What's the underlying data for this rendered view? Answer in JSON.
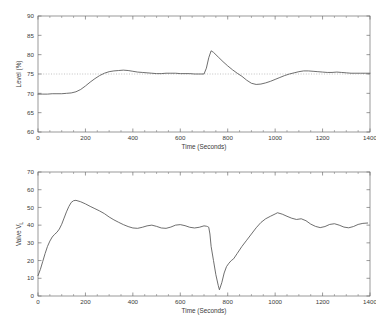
{
  "page": {
    "title_remnant": "",
    "background": "#ffffff",
    "line_color": "#555555",
    "axis_color": "#6e6e6e",
    "setpoint_color": "#9a9a9a"
  },
  "chart_data": [
    {
      "type": "line",
      "id": "level-chart",
      "title": "",
      "xlabel": "Time (Seconds)",
      "ylabel": "Level (%)",
      "xlim": [
        0,
        1400
      ],
      "ylim": [
        60,
        90
      ],
      "xticks": [
        0,
        200,
        400,
        600,
        800,
        1000,
        1200,
        1400
      ],
      "yticks": [
        60,
        65,
        70,
        75,
        80,
        85,
        90
      ],
      "grid": false,
      "legend": "none",
      "annotations": [
        {
          "kind": "setpoint-line",
          "y": 75,
          "style": "dotted"
        }
      ],
      "series": [
        {
          "name": "Level",
          "x": [
            0,
            20,
            40,
            60,
            80,
            100,
            120,
            140,
            160,
            180,
            200,
            220,
            240,
            260,
            280,
            300,
            320,
            340,
            360,
            380,
            400,
            420,
            440,
            460,
            480,
            500,
            520,
            540,
            560,
            580,
            600,
            620,
            640,
            660,
            680,
            700,
            710,
            720,
            730,
            740,
            760,
            780,
            800,
            820,
            840,
            860,
            880,
            900,
            920,
            940,
            960,
            980,
            1000,
            1020,
            1040,
            1060,
            1080,
            1100,
            1120,
            1140,
            1160,
            1180,
            1200,
            1220,
            1240,
            1260,
            1280,
            1300,
            1320,
            1340,
            1360,
            1380,
            1400
          ],
          "y": [
            69.8,
            69.8,
            69.8,
            69.9,
            69.9,
            69.9,
            70.0,
            70.1,
            70.4,
            71.0,
            71.9,
            72.9,
            73.8,
            74.6,
            75.2,
            75.6,
            75.8,
            75.9,
            76.0,
            75.9,
            75.7,
            75.5,
            75.4,
            75.3,
            75.2,
            75.1,
            75.1,
            75.2,
            75.2,
            75.2,
            75.1,
            75.1,
            75.1,
            75.0,
            75.0,
            75.0,
            76.5,
            79.2,
            81.0,
            80.6,
            79.4,
            78.2,
            77.1,
            76.1,
            75.2,
            74.4,
            73.4,
            72.6,
            72.3,
            72.4,
            72.7,
            73.1,
            73.6,
            74.1,
            74.6,
            75.0,
            75.3,
            75.6,
            75.8,
            75.8,
            75.7,
            75.6,
            75.5,
            75.4,
            75.4,
            75.5,
            75.4,
            75.3,
            75.2,
            75.2,
            75.2,
            75.2,
            75.2
          ]
        }
      ]
    },
    {
      "type": "line",
      "id": "valve-chart",
      "title": "",
      "xlabel": "Time (Seconds)",
      "ylabel": "Valve V",
      "ylabel_sub": "L",
      "xlim": [
        0,
        1400
      ],
      "ylim": [
        0,
        70
      ],
      "xticks": [
        0,
        200,
        400,
        600,
        800,
        1000,
        1200,
        1400
      ],
      "yticks": [
        0,
        10,
        20,
        30,
        40,
        50,
        60,
        70
      ],
      "grid": false,
      "legend": "none",
      "annotations": [],
      "series": [
        {
          "name": "Valve VL",
          "x": [
            0,
            10,
            20,
            30,
            40,
            50,
            60,
            70,
            80,
            90,
            100,
            110,
            120,
            130,
            140,
            150,
            160,
            180,
            200,
            220,
            240,
            260,
            280,
            300,
            320,
            340,
            360,
            380,
            400,
            420,
            440,
            460,
            480,
            500,
            520,
            540,
            560,
            580,
            600,
            620,
            640,
            660,
            680,
            700,
            710,
            715,
            720,
            725,
            730,
            740,
            750,
            760,
            765,
            775,
            785,
            795,
            805,
            815,
            825,
            840,
            860,
            880,
            900,
            920,
            940,
            960,
            980,
            1000,
            1010,
            1030,
            1050,
            1070,
            1090,
            1110,
            1130,
            1150,
            1170,
            1190,
            1210,
            1230,
            1250,
            1270,
            1290,
            1310,
            1330,
            1350,
            1370,
            1390,
            1400
          ],
          "y": [
            11.5,
            15.0,
            19.5,
            24.0,
            28.0,
            31.0,
            33.3,
            34.8,
            36.0,
            37.8,
            40.5,
            44.0,
            47.5,
            50.5,
            52.8,
            53.8,
            54.0,
            53.2,
            52.0,
            50.6,
            49.3,
            48.0,
            46.5,
            44.6,
            43.0,
            41.6,
            40.3,
            39.2,
            38.4,
            38.2,
            38.8,
            39.6,
            40.0,
            39.3,
            38.4,
            38.2,
            38.9,
            40.0,
            40.3,
            39.7,
            38.8,
            38.4,
            38.8,
            39.6,
            39.4,
            39.2,
            38.8,
            35.0,
            28.0,
            20.0,
            12.0,
            6.0,
            3.5,
            7.5,
            13.0,
            16.6,
            18.5,
            20.0,
            21.0,
            24.0,
            28.0,
            31.5,
            35.0,
            38.5,
            41.5,
            43.6,
            45.0,
            46.3,
            47.0,
            46.2,
            45.0,
            43.9,
            43.2,
            43.6,
            42.5,
            40.6,
            39.3,
            38.6,
            39.2,
            40.4,
            40.8,
            40.0,
            38.9,
            38.5,
            39.2,
            40.4,
            41.0,
            41.2
          ]
        }
      ]
    }
  ]
}
